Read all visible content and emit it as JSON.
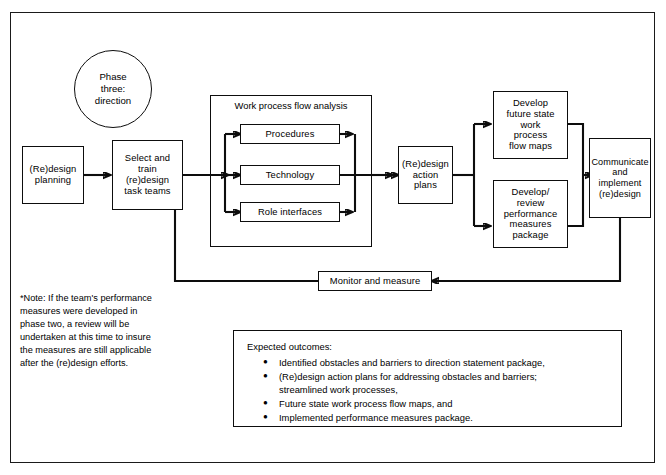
{
  "diagram": {
    "phase_circle": "Phase\nthree:\ndirection",
    "nodes": {
      "redesign_planning": "(Re)design\nplanning",
      "select_train": "Select and\ntrain\n(re)design\ntask teams",
      "procedures": "Procedures",
      "technology": "Technology",
      "role_interfaces": "Role interfaces",
      "action_plans": "(Re)design\naction\nplans",
      "future_state": "Develop\nfuture state\nwork\nprocess\nflow maps",
      "performance_measures": "Develop/\nreview\nperformance\nmeasures\npackage",
      "communicate": "Communicate\nand\nimplement\n(re)design",
      "monitor": "Monitor and measure"
    },
    "group_title": "Work process flow analysis",
    "note": "*Note: If the team's performance\n  measures were developed in\n  phase two, a review will be\n  undertaken at this time to insure\n  the measures are still applicable\n  after the (re)design efforts.",
    "outcomes": {
      "title": "Expected outcomes:",
      "items": [
        "Identified obstacles and barriers to direction statement package,",
        "(Re)design action plans for addressing obstacles and barriers;\nstreamlined work processes,",
        "Future state work process flow maps, and",
        "Implemented performance measures package."
      ]
    },
    "colors": {
      "ink": "#0d0d0d",
      "paper": "#ffffff"
    }
  }
}
